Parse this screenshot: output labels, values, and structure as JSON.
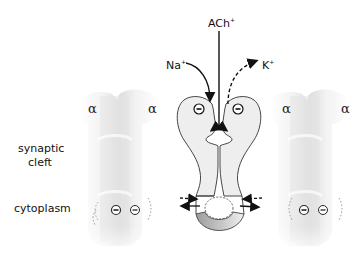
{
  "diagram": {
    "labels": {
      "ligand": "ACh",
      "ligand_charge": "+",
      "ion_in": "Na",
      "ion_in_charge": "+",
      "ion_out": "K",
      "ion_out_charge": "+",
      "region_top_line1": "synaptic",
      "region_top_line2": "cleft",
      "region_bottom": "cytoplasm",
      "subunit": "α",
      "negative_charge": "−"
    },
    "subunits": [
      {
        "name": "left-receptor",
        "alpha_labels": [
          "α",
          "α"
        ],
        "style": "faded"
      },
      {
        "name": "center-receptor-cross-section",
        "style": "outlined"
      },
      {
        "name": "right-receptor",
        "alpha_labels": [
          "α",
          "α"
        ],
        "style": "faded"
      }
    ],
    "colors": {
      "line": "#222222",
      "faded_body": "#e6e6e6",
      "faded_shadow": "#cfcfcf",
      "channel_fill": "#eeeeee",
      "gate_fill_dark": "#a8a8a8",
      "gate_fill_light": "#e8e8e8"
    }
  }
}
